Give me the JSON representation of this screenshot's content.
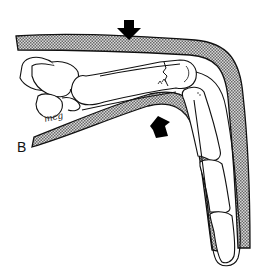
{
  "figure": {
    "panel_label": "B",
    "signature": "mcg",
    "colors": {
      "line": "#111111",
      "splint_hatch_dark": "#6a6a6a",
      "splint_hatch_light": "#d8d8d8",
      "background": "#ffffff",
      "arrow": "#000000"
    },
    "arrows": [
      {
        "name": "dorsal-pressure-arrow",
        "direction": "down"
      },
      {
        "name": "volar-pressure-arrow",
        "direction": "up"
      }
    ]
  }
}
